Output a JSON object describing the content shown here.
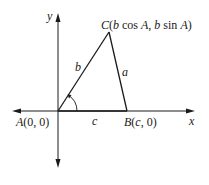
{
  "diagram": {
    "axes": {
      "x_label": "x",
      "y_label": "y"
    },
    "vertices": {
      "A": {
        "name": "A",
        "coords": "(0, 0)"
      },
      "B": {
        "name": "B",
        "coords_open": "(",
        "coords_var": "c",
        "coords_close": ", 0)"
      },
      "C": {
        "name": "C",
        "open": "(",
        "b1": "b",
        "cos": " cos ",
        "A1": "A",
        "comma": ", ",
        "b2": "b",
        "sin": " sin ",
        "A2": "A",
        "close": ")"
      }
    },
    "sides": {
      "a": "a",
      "b": "b",
      "c": "c"
    },
    "colors": {
      "line": "#1a1a1a",
      "background": "#ffffff"
    }
  }
}
